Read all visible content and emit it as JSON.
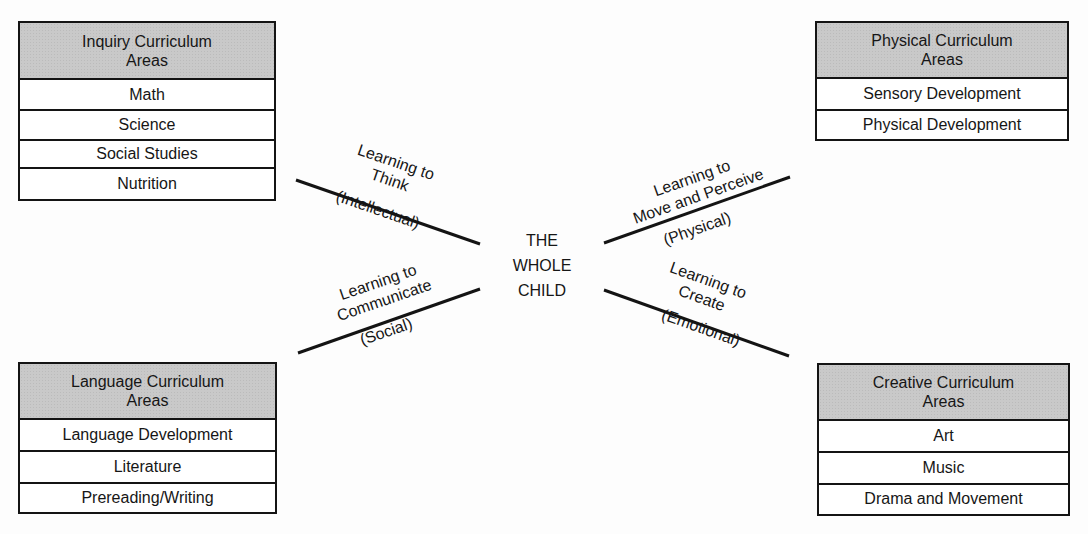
{
  "center": {
    "lines": [
      "THE",
      "WHOLE",
      "CHILD"
    ]
  },
  "boxes": {
    "inquiry": {
      "header": [
        "Inquiry Curriculum",
        "Areas"
      ],
      "items": [
        "Math",
        "Science",
        "Social Studies",
        "Nutrition"
      ]
    },
    "physical": {
      "header": [
        "Physical Curriculum",
        "Areas"
      ],
      "items": [
        "Sensory Development",
        "Physical Development"
      ]
    },
    "language": {
      "header": [
        "Language Curriculum",
        "Areas"
      ],
      "items": [
        "Language Development",
        "Literature",
        "Prereading/Writing"
      ]
    },
    "creative": {
      "header": [
        "Creative Curriculum",
        "Areas"
      ],
      "items": [
        "Art",
        "Music",
        "Drama and Movement"
      ]
    }
  },
  "branches": {
    "think": {
      "above": [
        "Learning to",
        "Think"
      ],
      "below": "(Intellectual)"
    },
    "communicate": {
      "above": [
        "Learning to",
        "Communicate"
      ],
      "below": "(Social)"
    },
    "move": {
      "above": [
        "Learning to",
        "Move and Perceive"
      ],
      "below": "(Physical)"
    },
    "create": {
      "above": [
        "Learning to",
        "Create"
      ],
      "below": "(Emotional)"
    }
  },
  "colors": {
    "header_fill": "#c9c9c9",
    "line": "#141414",
    "background": "#fdfdfd"
  }
}
